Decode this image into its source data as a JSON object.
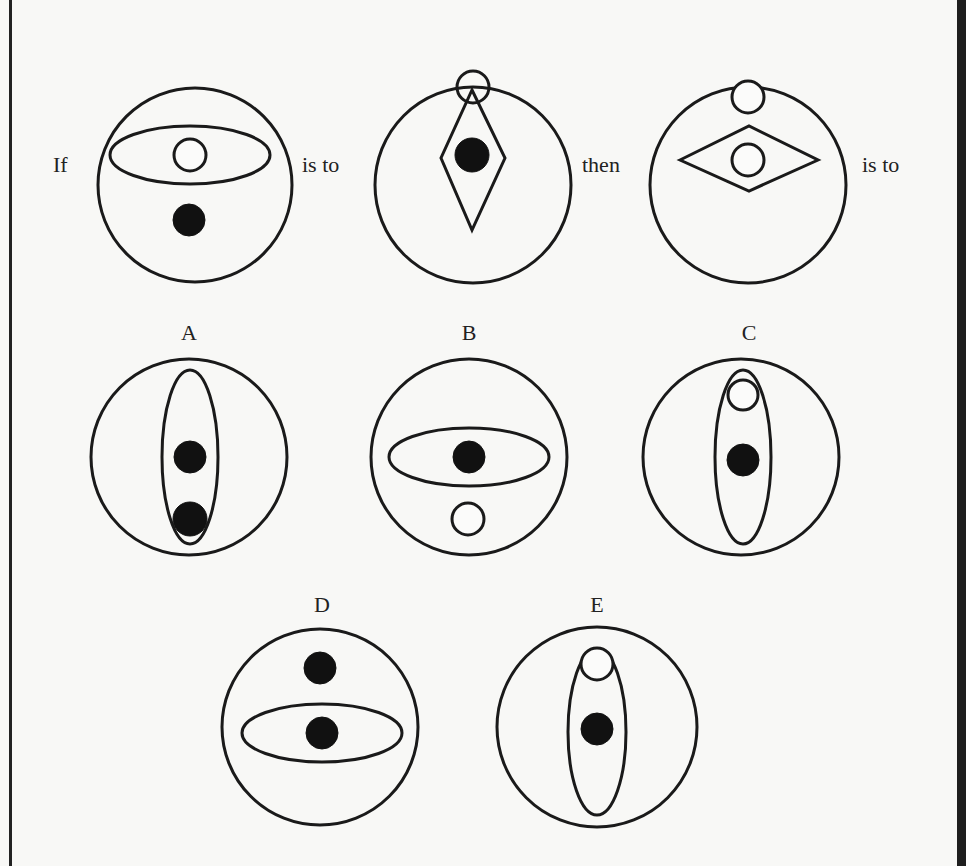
{
  "question": {
    "words": [
      "If",
      "is to",
      "then",
      "is to"
    ],
    "stem_figures": [
      {
        "id": "stem-1",
        "description": "Horizontal ellipse containing a small open circle; a black dot below the ellipse",
        "outer_circle": {
          "cx": 195,
          "cy": 185,
          "r": 97
        },
        "shapes": [
          {
            "type": "ellipse",
            "cx": 190,
            "cy": 155,
            "rx": 80,
            "ry": 29,
            "fill": "none"
          },
          {
            "type": "circle",
            "cx": 190,
            "cy": 155,
            "r": 16,
            "fill": "open"
          },
          {
            "type": "circle",
            "cx": 189,
            "cy": 220,
            "r": 16,
            "fill": "solid"
          }
        ]
      },
      {
        "id": "stem-2",
        "description": "Vertical diamond containing a black dot; small open circle at the top vertex",
        "outer_circle": {
          "cx": 473,
          "cy": 185,
          "r": 98
        },
        "shapes": [
          {
            "type": "polygon",
            "points": "472,90 505,158 472,230 441,158",
            "fill": "none"
          },
          {
            "type": "circle",
            "cx": 473,
            "cy": 87,
            "r": 16,
            "fill": "open-transparent"
          },
          {
            "type": "circle",
            "cx": 472,
            "cy": 155,
            "r": 17,
            "fill": "solid"
          }
        ]
      },
      {
        "id": "stem-3",
        "description": "Small open circle above a horizontal diamond that contains another open circle",
        "outer_circle": {
          "cx": 748,
          "cy": 185,
          "r": 98
        },
        "shapes": [
          {
            "type": "circle",
            "cx": 748,
            "cy": 97,
            "r": 16,
            "fill": "open"
          },
          {
            "type": "polygon",
            "points": "680,160 749,126 818,160 749,191",
            "fill": "none"
          },
          {
            "type": "circle",
            "cx": 748,
            "cy": 160,
            "r": 16,
            "fill": "open"
          }
        ]
      }
    ]
  },
  "options": [
    {
      "label": "A",
      "label_pos": {
        "x": 189,
        "y": 340
      },
      "outer_circle": {
        "cx": 189,
        "cy": 457,
        "r": 98
      },
      "shapes": [
        {
          "type": "ellipse",
          "cx": 190,
          "cy": 457,
          "rx": 28,
          "ry": 87,
          "fill": "none"
        },
        {
          "type": "circle",
          "cx": 190,
          "cy": 457,
          "r": 16,
          "fill": "solid"
        },
        {
          "type": "circle",
          "cx": 190,
          "cy": 519,
          "r": 17,
          "fill": "solid"
        }
      ]
    },
    {
      "label": "B",
      "label_pos": {
        "x": 469,
        "y": 340
      },
      "outer_circle": {
        "cx": 469,
        "cy": 457,
        "r": 98
      },
      "shapes": [
        {
          "type": "ellipse",
          "cx": 469,
          "cy": 457,
          "rx": 80,
          "ry": 29,
          "fill": "none"
        },
        {
          "type": "circle",
          "cx": 469,
          "cy": 457,
          "r": 16,
          "fill": "solid"
        },
        {
          "type": "circle",
          "cx": 468,
          "cy": 519,
          "r": 16,
          "fill": "open"
        }
      ]
    },
    {
      "label": "C",
      "label_pos": {
        "x": 749,
        "y": 340
      },
      "outer_circle": {
        "cx": 741,
        "cy": 457,
        "r": 98
      },
      "shapes": [
        {
          "type": "ellipse",
          "cx": 743,
          "cy": 457,
          "rx": 28,
          "ry": 87,
          "fill": "none"
        },
        {
          "type": "circle",
          "cx": 743,
          "cy": 395,
          "r": 15,
          "fill": "open"
        },
        {
          "type": "circle",
          "cx": 743,
          "cy": 460,
          "r": 16,
          "fill": "solid"
        }
      ]
    },
    {
      "label": "D",
      "label_pos": {
        "x": 322,
        "y": 612
      },
      "outer_circle": {
        "cx": 320,
        "cy": 727,
        "r": 98
      },
      "shapes": [
        {
          "type": "ellipse",
          "cx": 322,
          "cy": 733,
          "rx": 80,
          "ry": 29,
          "fill": "none"
        },
        {
          "type": "circle",
          "cx": 320,
          "cy": 668,
          "r": 16,
          "fill": "solid"
        },
        {
          "type": "circle",
          "cx": 322,
          "cy": 733,
          "r": 16,
          "fill": "solid"
        }
      ]
    },
    {
      "label": "E",
      "label_pos": {
        "x": 597,
        "y": 612
      },
      "outer_circle": {
        "cx": 597,
        "cy": 727,
        "r": 100
      },
      "shapes": [
        {
          "type": "ellipse",
          "cx": 597,
          "cy": 732,
          "rx": 29,
          "ry": 83,
          "fill": "none"
        },
        {
          "type": "circle",
          "cx": 597,
          "cy": 664,
          "r": 16,
          "fill": "open"
        },
        {
          "type": "circle",
          "cx": 597,
          "cy": 729,
          "r": 16,
          "fill": "solid"
        }
      ]
    }
  ],
  "colors": {
    "background": "#f8f8f6",
    "ink": "#1a1a1a",
    "border_right": "#1e1e1e"
  }
}
